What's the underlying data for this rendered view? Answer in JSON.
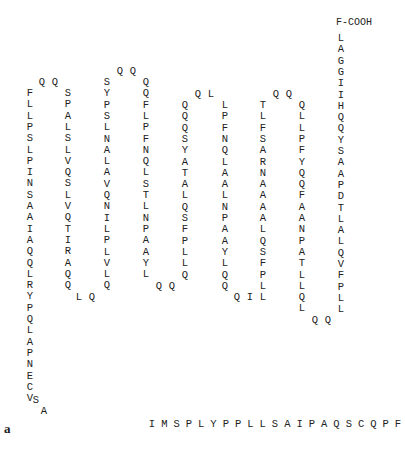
{
  "figure_label": "a",
  "n_terminus_label": "T-NH",
  "n_terminus_subscript": "2",
  "c_terminus_label": "F-COOH",
  "row_spacing": 11.3,
  "segments": [
    {
      "id": "h1",
      "dir": "down",
      "x": 30,
      "y": 88,
      "seq": "FLLPSLPINSAAIAQQLRYPQLAPNECV"
    },
    {
      "id": "tail1",
      "type": "diag",
      "points": [
        [
          36,
          395,
          "S"
        ],
        [
          44,
          406,
          "A"
        ]
      ]
    },
    {
      "id": "loop1",
      "type": "pts",
      "points": [
        [
          42,
          77,
          "Q"
        ],
        [
          55,
          77,
          "Q"
        ]
      ]
    },
    {
      "id": "h2",
      "dir": "down",
      "x": 68,
      "y": 88,
      "seq": "SPALSLVQSLVQTIRAQQ"
    },
    {
      "id": "loop2",
      "type": "pts",
      "points": [
        [
          79,
          292,
          "L"
        ],
        [
          92,
          292,
          "Q"
        ]
      ]
    },
    {
      "id": "h3",
      "dir": "down",
      "x": 107,
      "y": 77,
      "seq": "SYPSLNALAVQNILPLVLQ"
    },
    {
      "id": "loop3",
      "type": "pts",
      "points": [
        [
          120,
          66,
          "Q"
        ],
        [
          133,
          66,
          "Q"
        ]
      ]
    },
    {
      "id": "h4",
      "dir": "down",
      "x": 146,
      "y": 77,
      "seq": "QQFLPFNQLSTLNPAAYL"
    },
    {
      "id": "loop4",
      "type": "pts",
      "points": [
        [
          159,
          281,
          "Q"
        ],
        [
          172,
          281,
          "Q"
        ]
      ]
    },
    {
      "id": "h5",
      "dir": "down",
      "x": 185,
      "y": 100,
      "seq": "QQQSYATALQSFPLLQ"
    },
    {
      "id": "loop5",
      "type": "pts",
      "points": [
        [
          198,
          89,
          "Q"
        ],
        [
          211,
          89,
          "L"
        ]
      ]
    },
    {
      "id": "h6",
      "dir": "down",
      "x": 225,
      "y": 100,
      "seq": "LPFNQLAALNPAAYLQQ"
    },
    {
      "id": "loop6",
      "type": "pts",
      "points": [
        [
          237,
          292,
          "Q"
        ],
        [
          250,
          292,
          "I"
        ]
      ]
    },
    {
      "id": "h7",
      "dir": "down",
      "x": 263,
      "y": 100,
      "seq": "TLFSARNAAAALQSFPLL"
    },
    {
      "id": "loop7",
      "type": "pts",
      "points": [
        [
          276,
          89,
          "Q"
        ],
        [
          289,
          89,
          "Q"
        ]
      ]
    },
    {
      "id": "h8",
      "dir": "down",
      "x": 302,
      "y": 100,
      "seq": "QLLPFYQQFAANPATLLQL"
    },
    {
      "id": "loop8",
      "type": "pts",
      "points": [
        [
          315,
          315,
          "Q"
        ],
        [
          328,
          315,
          "Q"
        ]
      ]
    },
    {
      "id": "h9",
      "dir": "down",
      "x": 341,
      "y": 33,
      "seq": "LAGGIIHQQYSAAPDTLALQVFPLL"
    }
  ],
  "bottom_tail": {
    "x": 152,
    "y": 419,
    "spacing": 12.3,
    "seq": "IMSPLYPPLLSAIPAQSCQPFI"
  }
}
